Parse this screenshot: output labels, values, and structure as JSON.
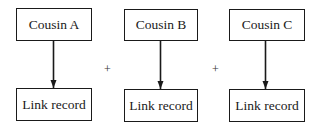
{
  "diagram": {
    "columns": [
      {
        "top_label": "Cousin A",
        "bottom_label": "Link record"
      },
      {
        "top_label": "Cousin B",
        "bottom_label": "Link record"
      },
      {
        "top_label": "Cousin C",
        "bottom_label": "Link record"
      }
    ],
    "operators": [
      "+",
      "+"
    ]
  }
}
